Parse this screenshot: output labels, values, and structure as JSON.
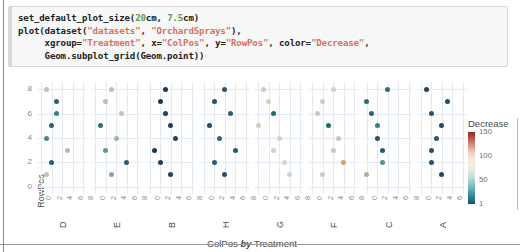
{
  "notebook": {
    "code_lines": [
      {
        "segments": [
          {
            "t": "set_default_plot_size(",
            "c": "plain"
          },
          {
            "t": "20",
            "c": "num"
          },
          {
            "t": "cm, ",
            "c": "plain"
          },
          {
            "t": "7.5",
            "c": "num"
          },
          {
            "t": "cm)",
            "c": "plain"
          }
        ]
      },
      {
        "segments": [
          {
            "t": "plot(dataset(",
            "c": "plain"
          },
          {
            "t": "\"datasets\"",
            "c": "str"
          },
          {
            "t": ", ",
            "c": "plain"
          },
          {
            "t": "\"OrchardSprays\"",
            "c": "str"
          },
          {
            "t": "),",
            "c": "plain"
          }
        ]
      },
      {
        "segments": [
          {
            "t": "     xgroup=",
            "c": "plain"
          },
          {
            "t": "\"Treatment\"",
            "c": "str"
          },
          {
            "t": ", x=",
            "c": "plain"
          },
          {
            "t": "\"ColPos\"",
            "c": "str"
          },
          {
            "t": ", y=",
            "c": "plain"
          },
          {
            "t": "\"RowPos\"",
            "c": "str"
          },
          {
            "t": ", color=",
            "c": "plain"
          },
          {
            "t": "\"Decrease\"",
            "c": "str"
          },
          {
            "t": ",",
            "c": "plain"
          }
        ]
      },
      {
        "segments": [
          {
            "t": "     Geom.subplot_grid(Geom.point))",
            "c": "plain"
          }
        ]
      }
    ],
    "raw_code": "set_default_plot_size(20cm, 7.5cm)\nplot(dataset(\"datasets\", \"OrchardSprays\"),\n     xgroup=\"Treatment\", x=\"ColPos\", y=\"RowPos\", color=\"Decrease\",\n     Geom.subplot_grid(Geom.point))"
  },
  "chart_data": {
    "type": "scatter",
    "title": "",
    "xlabel": "ColPos by Treatment",
    "xlabel_parts": {
      "pre": "ColPos ",
      "em": "by",
      "post": " Treatment"
    },
    "ylabel": "RowPos",
    "color_label": "Decrease",
    "xlim": [
      -0.6,
      8.6
    ],
    "ylim": [
      -0.6,
      8.6
    ],
    "xticks": [
      0,
      2,
      4,
      6,
      8
    ],
    "yticks": [
      0,
      2,
      4,
      6,
      8
    ],
    "grid": true,
    "legend_position": "right",
    "colorbar": {
      "label": "Decrease",
      "ticks": [
        150,
        100,
        50,
        1
      ],
      "vmin": 1,
      "vmax": 150,
      "high_color": "#8b2a21",
      "mid_color": "#f2efe4",
      "low_color": "#14536d"
    },
    "facet_variable": "Treatment",
    "facets": [
      {
        "label": "D",
        "points": [
          {
            "x": 1,
            "y": 8,
            "decrease": 90,
            "color": "#b9c2bd"
          },
          {
            "x": 3,
            "y": 7,
            "decrease": 24,
            "color": "#2d6072"
          },
          {
            "x": 3,
            "y": 6,
            "decrease": 36,
            "color": "#3a7f86"
          },
          {
            "x": 2,
            "y": 5,
            "decrease": 22,
            "color": "#27666e"
          },
          {
            "x": 1,
            "y": 4,
            "decrease": 40,
            "color": "#4b8a84"
          },
          {
            "x": 5,
            "y": 3,
            "decrease": 84,
            "color": "#b2bfb9"
          },
          {
            "x": 2,
            "y": 2,
            "decrease": 27,
            "color": "#2a5f73"
          },
          {
            "x": 1,
            "y": 1,
            "decrease": 95,
            "color": "#bdc4bf"
          }
        ]
      },
      {
        "label": "E",
        "points": [
          {
            "x": 3,
            "y": 8,
            "decrease": 92,
            "color": "#b8c1bc"
          },
          {
            "x": 2,
            "y": 7,
            "decrease": 88,
            "color": "#b5c0bb"
          },
          {
            "x": 5,
            "y": 6,
            "decrease": 95,
            "color": "#bec5c0"
          },
          {
            "x": 1,
            "y": 5,
            "decrease": 30,
            "color": "#2f6d78"
          },
          {
            "x": 4,
            "y": 4,
            "decrease": 70,
            "color": "#9ab5b2"
          },
          {
            "x": 2,
            "y": 3,
            "decrease": 45,
            "color": "#5e9691"
          },
          {
            "x": 6,
            "y": 2,
            "decrease": 26,
            "color": "#2a6072"
          },
          {
            "x": 3,
            "y": 1,
            "decrease": 58,
            "color": "#7ea8a4"
          }
        ]
      },
      {
        "label": "B",
        "points": [
          {
            "x": 3,
            "y": 8,
            "decrease": 9,
            "color": "#1d3b55"
          },
          {
            "x": 2,
            "y": 7,
            "decrease": 7,
            "color": "#1b3852"
          },
          {
            "x": 3,
            "y": 6,
            "decrease": 12,
            "color": "#22405a"
          },
          {
            "x": 4,
            "y": 5,
            "decrease": 10,
            "color": "#1f3d57"
          },
          {
            "x": 5,
            "y": 4,
            "decrease": 14,
            "color": "#24435e"
          },
          {
            "x": 1,
            "y": 3,
            "decrease": 8,
            "color": "#1c3953"
          },
          {
            "x": 2,
            "y": 2,
            "decrease": 11,
            "color": "#203e58"
          },
          {
            "x": 4,
            "y": 1,
            "decrease": 13,
            "color": "#23415b"
          }
        ]
      },
      {
        "label": "H",
        "points": [
          {
            "x": 4,
            "y": 8,
            "decrease": 20,
            "color": "#2b5a6e"
          },
          {
            "x": 2,
            "y": 7,
            "decrease": 18,
            "color": "#27526a"
          },
          {
            "x": 5,
            "y": 6,
            "decrease": 23,
            "color": "#2c6174"
          },
          {
            "x": 1,
            "y": 5,
            "decrease": 16,
            "color": "#244d66"
          },
          {
            "x": 3,
            "y": 4,
            "decrease": 25,
            "color": "#2e6878"
          },
          {
            "x": 6,
            "y": 3,
            "decrease": 19,
            "color": "#29566c"
          },
          {
            "x": 2,
            "y": 2,
            "decrease": 21,
            "color": "#2a5c70"
          },
          {
            "x": 4,
            "y": 1,
            "decrease": 17,
            "color": "#264f68"
          }
        ]
      },
      {
        "label": "G",
        "points": [
          {
            "x": 1,
            "y": 8,
            "decrease": 105,
            "color": "#cbcdc3"
          },
          {
            "x": 2,
            "y": 7,
            "decrease": 112,
            "color": "#d2d1c6"
          },
          {
            "x": 3,
            "y": 6,
            "decrease": 35,
            "color": "#1e6f72"
          },
          {
            "x": 0,
            "y": 5,
            "decrease": 108,
            "color": "#cdcec4"
          },
          {
            "x": 4,
            "y": 4,
            "decrease": 118,
            "color": "#d6d4c8"
          },
          {
            "x": 3,
            "y": 3,
            "decrease": 110,
            "color": "#d0cfc5"
          },
          {
            "x": 5,
            "y": 2,
            "decrease": 120,
            "color": "#d8d6ca"
          },
          {
            "x": 6,
            "y": 1,
            "decrease": 115,
            "color": "#d4d2c7"
          }
        ]
      },
      {
        "label": "F",
        "points": [
          {
            "x": 4,
            "y": 8,
            "decrease": 114,
            "color": "#d3d2c7"
          },
          {
            "x": 2,
            "y": 7,
            "decrease": 106,
            "color": "#cccec4"
          },
          {
            "x": 1,
            "y": 6,
            "decrease": 102,
            "color": "#c9ccC2"
          },
          {
            "x": 3,
            "y": 5,
            "decrease": 33,
            "color": "#1c6e71"
          },
          {
            "x": 5,
            "y": 4,
            "decrease": 96,
            "color": "#c3c8bf"
          },
          {
            "x": 4,
            "y": 3,
            "decrease": 99,
            "color": "#c6cac1"
          },
          {
            "x": 6,
            "y": 2,
            "decrease": 140,
            "color": "#d9a35f"
          },
          {
            "x": 2,
            "y": 1,
            "decrease": 104,
            "color": "#cbcdc3"
          }
        ]
      },
      {
        "label": "C",
        "points": [
          {
            "x": 4,
            "y": 8,
            "decrease": 50,
            "color": "#2f6f7c"
          },
          {
            "x": 0,
            "y": 7,
            "decrease": 38,
            "color": "#2a6b74"
          },
          {
            "x": 1,
            "y": 6,
            "decrease": 44,
            "color": "#2b6676"
          },
          {
            "x": 2,
            "y": 5,
            "decrease": 42,
            "color": "#3a7d80"
          },
          {
            "x": 2,
            "y": 4,
            "decrease": 28,
            "color": "#27536a"
          },
          {
            "x": 3,
            "y": 3,
            "decrease": 31,
            "color": "#2a5a6e"
          },
          {
            "x": 3,
            "y": 2,
            "decrease": 60,
            "color": "#5a8f8a"
          },
          {
            "x": 0,
            "y": 1,
            "decrease": 130,
            "color": "#b5aca0"
          }
        ]
      },
      {
        "label": "A",
        "points": [
          {
            "x": 1,
            "y": 8,
            "decrease": 15,
            "color": "#22445e"
          },
          {
            "x": 5,
            "y": 7,
            "decrease": 18,
            "color": "#264d66"
          },
          {
            "x": 2,
            "y": 6,
            "decrease": 20,
            "color": "#2a5568"
          },
          {
            "x": 4,
            "y": 5,
            "decrease": 17,
            "color": "#254b63"
          },
          {
            "x": 3,
            "y": 4,
            "decrease": 22,
            "color": "#2b5a6c"
          },
          {
            "x": 2,
            "y": 3,
            "decrease": 19,
            "color": "#27506a"
          },
          {
            "x": 2,
            "y": 2,
            "decrease": 21,
            "color": "#295468"
          },
          {
            "x": 4,
            "y": 1,
            "decrease": 16,
            "color": "#234862"
          }
        ]
      }
    ]
  }
}
